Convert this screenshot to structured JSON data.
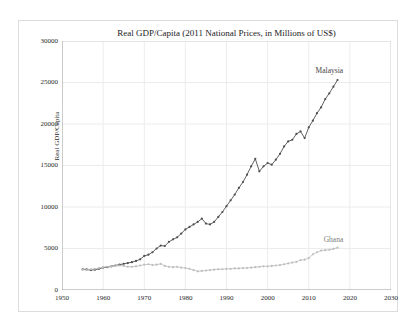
{
  "figure": {
    "background": "#ffffff",
    "border_color": "#dcdcdc",
    "grid_color": "#ececec",
    "spine_color": "#9a9a9a",
    "text_color": "#2a2a2a"
  },
  "chart_data": {
    "type": "line",
    "title": "Real GDP/Capita (2011 National Prices, in Millions of US$)",
    "ylabel": "Real GDP/Capita",
    "xlabel": "",
    "xlim": [
      1950,
      2030
    ],
    "ylim": [
      0,
      30000
    ],
    "x_ticks": [
      1950,
      1960,
      1970,
      1980,
      1990,
      2000,
      2010,
      2020,
      2030
    ],
    "y_ticks": [
      0,
      5000,
      10000,
      15000,
      20000,
      25000,
      30000
    ],
    "grid": true,
    "legend_position": "inline-annotations",
    "x": [
      1955,
      1956,
      1957,
      1958,
      1959,
      1960,
      1961,
      1962,
      1963,
      1964,
      1965,
      1966,
      1967,
      1968,
      1969,
      1970,
      1971,
      1972,
      1973,
      1974,
      1975,
      1976,
      1977,
      1978,
      1979,
      1980,
      1981,
      1982,
      1983,
      1984,
      1985,
      1986,
      1987,
      1988,
      1989,
      1990,
      1991,
      1992,
      1993,
      1994,
      1995,
      1996,
      1997,
      1998,
      1999,
      2000,
      2001,
      2002,
      2003,
      2004,
      2005,
      2006,
      2007,
      2008,
      2009,
      2010,
      2011,
      2012,
      2013,
      2014,
      2015,
      2016,
      2017
    ],
    "series": [
      {
        "name": "Malaysia",
        "color": "#4f4f4f",
        "label_color": "#3f3f3f",
        "values": [
          2500,
          2480,
          2400,
          2450,
          2550,
          2700,
          2750,
          2850,
          2950,
          3050,
          3150,
          3250,
          3350,
          3500,
          3700,
          4100,
          4250,
          4550,
          5000,
          5350,
          5300,
          5800,
          6100,
          6350,
          6800,
          7300,
          7600,
          7900,
          8200,
          8600,
          8000,
          7900,
          8200,
          8800,
          9400,
          10100,
          10800,
          11500,
          12300,
          13000,
          13900,
          14900,
          15800,
          14300,
          14900,
          15300,
          15100,
          15700,
          16400,
          17300,
          17900,
          18100,
          18800,
          19100,
          18300,
          19600,
          20400,
          21300,
          22000,
          23000,
          23700,
          24500,
          25300
        ]
      },
      {
        "name": "Ghana",
        "color": "#bdbdbd",
        "label_color": "#7d7d7d",
        "values": [
          2450,
          2400,
          2500,
          2550,
          2650,
          2750,
          2800,
          2850,
          2900,
          2950,
          2900,
          2800,
          2800,
          2850,
          2950,
          3050,
          3100,
          3000,
          3050,
          3150,
          2900,
          2800,
          2750,
          2800,
          2700,
          2650,
          2550,
          2400,
          2250,
          2300,
          2350,
          2400,
          2450,
          2500,
          2500,
          2550,
          2550,
          2600,
          2600,
          2650,
          2650,
          2700,
          2750,
          2800,
          2850,
          2850,
          2900,
          2950,
          3000,
          3100,
          3200,
          3300,
          3400,
          3600,
          3650,
          3850,
          4300,
          4550,
          4750,
          4800,
          4850,
          4950,
          5100
        ]
      }
    ],
    "annotations": [
      {
        "text": "Malaysia",
        "x": 2015,
        "y": 26500,
        "series": 0
      },
      {
        "text": "Ghana",
        "x": 2016,
        "y": 6200,
        "series": 1
      }
    ]
  }
}
